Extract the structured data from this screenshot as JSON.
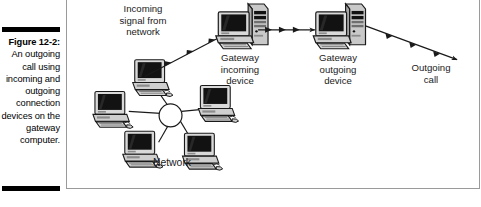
{
  "caption": {
    "figure_number": "Figure 12-2:",
    "description": "An outgoing\ncall using\nincoming\nand\noutgoing\nconnection\ndevices on\nthe gateway\ncomputer."
  },
  "figure": {
    "labels": {
      "incoming_signal": "Incoming\nsignal from\nnetwork",
      "gateway_incoming": "Gateway\nincoming\ndevice",
      "gateway_outgoing": "Gateway\noutgoing\ndevice",
      "outgoing_call": "Outgoing\ncall",
      "network": "Network"
    },
    "nodes": [
      {
        "id": "network-cluster",
        "kind": "star-topology",
        "computers": 5,
        "hub": "circle"
      },
      {
        "id": "gateway-incoming",
        "kind": "desktop-computer-with-tower"
      },
      {
        "id": "gateway-outgoing",
        "kind": "desktop-computer-with-tower"
      }
    ],
    "connectors": [
      {
        "id": "network-to-gateway-incoming",
        "style": "diagonal-up-right",
        "arrowheads": 4
      },
      {
        "id": "gateway-incoming-to-outgoing",
        "style": "horizontal-right",
        "arrowheads": 4
      },
      {
        "id": "gateway-outgoing-to-call",
        "style": "diagonal-down-right",
        "arrowheads": 4
      }
    ],
    "colors": {
      "line": "#1a1a1a",
      "frame_border": "#9a9a9a",
      "rule": "#000000",
      "screen_fill": "#111111",
      "case_fill": "#d8d8d8",
      "background": "#ffffff"
    }
  }
}
